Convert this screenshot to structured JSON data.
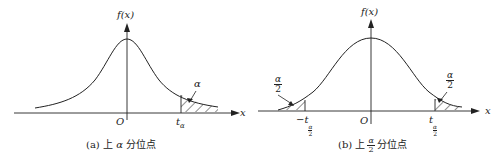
{
  "panels": [
    {
      "id": "a",
      "y_axis_label": "f(x)",
      "x_axis_label": "x",
      "origin_label": "O",
      "quantile_label": "t",
      "quantile_sub": "α",
      "tail_area_label": "α",
      "caption_prefix": "(a) 上",
      "caption_symbol": "α",
      "caption_suffix": "分位点"
    },
    {
      "id": "b",
      "y_axis_label": "f(x)",
      "x_axis_label": "x",
      "origin_label": "O",
      "left_quantile_label": "−t",
      "right_quantile_label": "t",
      "quantile_sub_num": "α",
      "quantile_sub_den": "2",
      "tail_area_num": "α",
      "tail_area_den": "2",
      "caption_prefix": "(b) 上",
      "caption_frac_num": "α",
      "caption_frac_den": "2",
      "caption_suffix": "分位点"
    }
  ],
  "colors": {
    "line": "#222222",
    "background": "#ffffff"
  }
}
